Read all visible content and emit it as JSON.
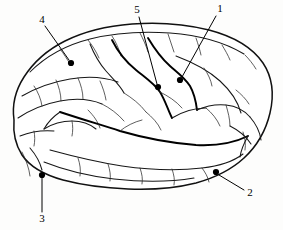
{
  "figure": {
    "background_color": "#fdfdfc",
    "ink_color": "#000000",
    "width": 283,
    "height": 230
  },
  "callouts": [
    {
      "id": "callout-1",
      "label": "1",
      "label_x": 220,
      "label_y": 9,
      "dot_x": 180,
      "dot_y": 80,
      "line_x1": 216,
      "line_y1": 16,
      "line_x2": 182,
      "line_y2": 77
    },
    {
      "id": "callout-2",
      "label": "2",
      "label_x": 250,
      "label_y": 193,
      "dot_x": 216,
      "dot_y": 172,
      "line_x1": 244,
      "line_y1": 190,
      "line_x2": 219,
      "line_y2": 175
    },
    {
      "id": "callout-3",
      "label": "3",
      "label_x": 42,
      "label_y": 219,
      "dot_x": 42,
      "dot_y": 175,
      "line_x1": 42,
      "line_y1": 212,
      "line_x2": 42,
      "line_y2": 178
    },
    {
      "id": "callout-4",
      "label": "4",
      "label_x": 42,
      "label_y": 20,
      "dot_x": 71,
      "dot_y": 63,
      "line_x1": 45,
      "line_y1": 26,
      "line_x2": 69,
      "line_y2": 60
    },
    {
      "id": "callout-5",
      "label": "5",
      "label_x": 137,
      "label_y": 10,
      "dot_x": 158,
      "dot_y": 87,
      "line_x1": 139,
      "line_y1": 17,
      "line_x2": 157,
      "line_y2": 84
    }
  ],
  "geometry": {
    "outline": "M 14 118 C 13 104, 17 88, 27 74 C 38 58, 54 44, 74 36 C 96 27, 122 23, 148 24 C 176 25, 204 27, 228 34 C 248 40, 263 52, 270 70 C 276 86, 274 104, 268 120 C 262 136, 252 150, 238 161 C 224 172, 208 180, 190 184 C 168 189, 144 190, 120 189 C 96 188, 72 186, 52 182 C 36 178, 24 170, 18 158 C 13 147, 13 132, 14 118 Z",
    "dot_radius": 3.1
  }
}
